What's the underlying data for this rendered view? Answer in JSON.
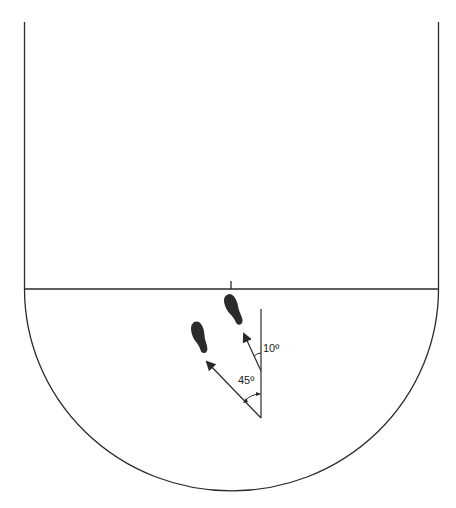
{
  "diagram": {
    "colors": {
      "line": "#2a2a2a",
      "footprint": "#2b2b2b",
      "background": "#ffffff"
    },
    "labels": {
      "angle_small": "10º",
      "angle_large": "45º"
    },
    "elements": {
      "court": {
        "left_x": 24,
        "right_x": 438,
        "baseline_y": 289
      },
      "center_tick": {
        "x": 231
      },
      "reference_line": {
        "x": 261
      },
      "arrows": [
        {
          "name": "10-degree-step",
          "angle_deg": 10
        },
        {
          "name": "45-degree-step",
          "angle_deg": 45
        }
      ],
      "footprints": [
        {
          "name": "right-foot",
          "position": "upper-right"
        },
        {
          "name": "left-foot",
          "position": "left"
        }
      ]
    }
  }
}
